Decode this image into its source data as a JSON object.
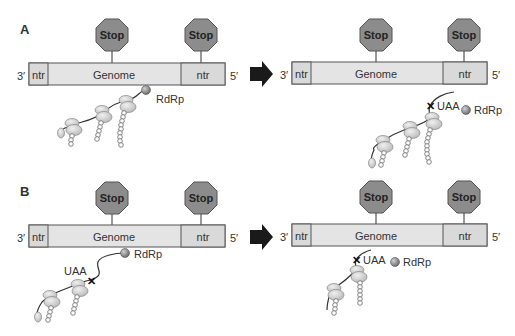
{
  "figure": {
    "panels": [
      {
        "label": "A",
        "before": {
          "end_left": "3′",
          "end_right": "5′",
          "segments": [
            "ntr",
            "Genome",
            "ntr"
          ],
          "stop_signs": [
            "Stop",
            "Stop"
          ],
          "polymerase": "RdRp"
        },
        "after": {
          "end_left": "3′",
          "end_right": "5′",
          "segments": [
            "ntr",
            "Genome",
            "ntr"
          ],
          "stop_signs": [
            "Stop",
            "Stop"
          ],
          "codon": "UAA",
          "polymerase": "RdRp"
        }
      },
      {
        "label": "B",
        "before": {
          "end_left": "3′",
          "end_right": "5′",
          "segments": [
            "ntr",
            "Genome",
            "ntr"
          ],
          "stop_signs": [
            "Stop",
            "Stop"
          ],
          "codon": "UAA",
          "polymerase": "RdRp"
        },
        "after": {
          "end_left": "3′",
          "end_right": "5′",
          "segments": [
            "ntr",
            "Genome",
            "ntr"
          ],
          "stop_signs": [
            "Stop",
            "Stop"
          ],
          "codon": "UAA",
          "polymerase": "RdRp"
        }
      }
    ],
    "colors": {
      "bar_fill": "#e4e4e4",
      "ntr_fill": "#d9d9d9",
      "stop_fill": "#8c8c8c",
      "ribosome_fill": "#cfcfcf",
      "rdrp_fill": "#8a8a8a",
      "arrow": "#1a1a1a"
    }
  }
}
